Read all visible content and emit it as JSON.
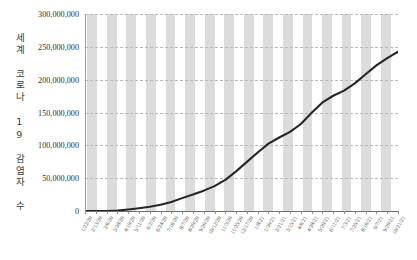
{
  "chart_data": {
    "type": "line",
    "title": "",
    "subtitle": "",
    "xlabel": "",
    "ylabel": "세계 코로나 19 감염자 수",
    "ylim": [
      0,
      300000000
    ],
    "ytick_values": [
      0,
      50000000,
      100000000,
      150000000,
      200000000,
      250000000,
      300000000
    ],
    "ytick_labels": [
      "0",
      "50,000,000",
      "100,000,000",
      "150,000,000",
      "200,000,000",
      "250,000,000",
      "300,000,000"
    ],
    "grid": "horizontal-dashed",
    "legend": "none",
    "band_color": "#dcdcdc",
    "line_color": "#262626",
    "gridline_color": "#b9b9b9",
    "axis_color": "#6f6f6f",
    "categories": [
      "1/22/20",
      "2/13/20",
      "3/6/20",
      "3/28/20",
      "4/19/20",
      "5/11/20",
      "6/2/20",
      "6/24/20",
      "7/16/20",
      "8/7/20",
      "8/29/20",
      "9/20/20",
      "10/12/20",
      "11/3/20",
      "11/25/20",
      "12/17/20",
      "1/8/21",
      "1/30/21",
      "2/21/21",
      "3/15/21",
      "4/6/21",
      "4/28/21",
      "5/20/21",
      "6/11/21",
      "7/3/21",
      "7/25/21",
      "8/16/21",
      "9/7/21",
      "9/29/21",
      "10/21/21"
    ],
    "values": [
      555,
      60328,
      101800,
      657000,
      2355000,
      4250000,
      6400000,
      9500000,
      13800000,
      19600000,
      25100000,
      31000000,
      37900000,
      47400000,
      60300000,
      74800000,
      89000000,
      102600000,
      111900000,
      120600000,
      132500000,
      149600000,
      165400000,
      175500000,
      183300000,
      194400000,
      208300000,
      221700000,
      232900000,
      242500000
    ],
    "series_name": "세계 코로나 19 감염자 수",
    "value_unit": "명",
    "band_count": 16,
    "data_point_count": 30,
    "x_axis_type": "date",
    "x_interval_days": 22
  }
}
